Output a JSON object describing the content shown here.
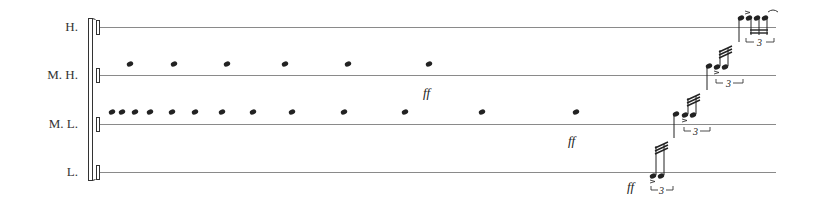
{
  "score": {
    "staves": [
      {
        "id": "H",
        "label": "H.",
        "y": 27
      },
      {
        "id": "MH",
        "label": "M. H.",
        "y": 75
      },
      {
        "id": "ML",
        "label": "M. L.",
        "y": 124
      },
      {
        "id": "L",
        "label": "L.",
        "y": 172
      }
    ],
    "staff_line_start_x": 100,
    "staff_line_end_x": 776,
    "colors": {
      "ink": "#222222",
      "line": "#8a8a8a"
    },
    "mh_notes_x": [
      130,
      174,
      227,
      285,
      348,
      429
    ],
    "mh_note_y": 64,
    "ml_notes_x": [
      112,
      122,
      135,
      150,
      172,
      195,
      222,
      253,
      292,
      344,
      405,
      482,
      576
    ],
    "ml_note_y": 112,
    "dynamics": [
      {
        "text": "ff",
        "x": 423,
        "y": 97
      },
      {
        "text": "ff",
        "x": 568,
        "y": 145
      },
      {
        "text": "ff",
        "x": 627,
        "y": 191
      }
    ],
    "tuplets": [
      {
        "number": "3",
        "x": 662,
        "y": 192
      },
      {
        "number": "3",
        "x": 695,
        "y": 143
      },
      {
        "number": "3",
        "x": 728,
        "y": 94
      },
      {
        "number": "3",
        "x": 760,
        "y": 45
      }
    ]
  }
}
